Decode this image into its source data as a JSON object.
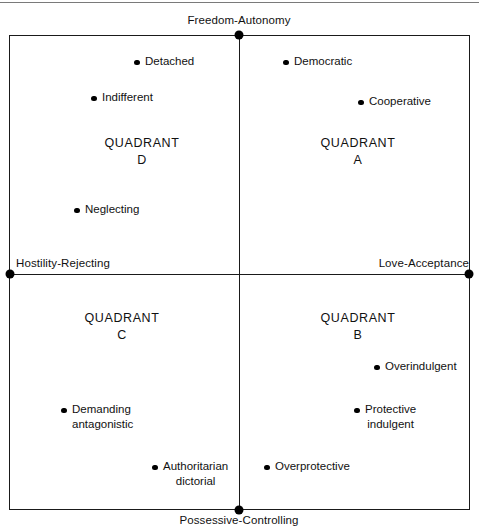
{
  "diagram": {
    "type": "two-axis-quadrant-map",
    "title_rule": true,
    "axes": {
      "top_label": "Freedom-Autonomy",
      "bottom_label": "Possessive-Controlling",
      "left_label": "Hostility-Rejecting",
      "right_label": "Love-Acceptance"
    },
    "quadrants": [
      {
        "id": "A",
        "name": "QUADRANT",
        "letter": "A",
        "x": 358,
        "y": 135
      },
      {
        "id": "B",
        "name": "QUADRANT",
        "letter": "B",
        "x": 358,
        "y": 310
      },
      {
        "id": "C",
        "name": "QUADRANT",
        "letter": "C",
        "x": 122,
        "y": 310
      },
      {
        "id": "D",
        "name": "QUADRANT",
        "letter": "D",
        "x": 142,
        "y": 135
      }
    ],
    "points": [
      {
        "label": "Detached",
        "label2": "",
        "quadrant": "D",
        "x": 134,
        "y": 61
      },
      {
        "label": "Indifferent",
        "label2": "",
        "quadrant": "D",
        "x": 91,
        "y": 97
      },
      {
        "label": "Neglecting",
        "label2": "",
        "quadrant": "D",
        "x": 74,
        "y": 209
      },
      {
        "label": "Democratic",
        "label2": "",
        "quadrant": "A",
        "x": 283,
        "y": 61
      },
      {
        "label": "Cooperative",
        "label2": "",
        "quadrant": "A",
        "x": 358,
        "y": 101
      },
      {
        "label": "Overindulgent",
        "label2": "",
        "quadrant": "B",
        "x": 374,
        "y": 366
      },
      {
        "label": "Protective",
        "label2": "indulgent",
        "quadrant": "B",
        "x": 354,
        "y": 409
      },
      {
        "label": "Overprotective",
        "label2": "",
        "quadrant": "B",
        "x": 264,
        "y": 466
      },
      {
        "label": "Demanding",
        "label2": "antagonistic",
        "quadrant": "C",
        "x": 61,
        "y": 409
      },
      {
        "label": "Authoritarian",
        "label2": "dictorial",
        "quadrant": "C",
        "x": 152,
        "y": 466
      }
    ],
    "axis_nodes": [
      {
        "name": "top-node",
        "x": 239,
        "y": 35
      },
      {
        "name": "bottom-node",
        "x": 239,
        "y": 510
      },
      {
        "name": "left-node",
        "x": 10,
        "y": 274
      },
      {
        "name": "right-node",
        "x": 469,
        "y": 274
      }
    ],
    "colors": {
      "line": "#1a1a1a",
      "text": "#111111",
      "rule": "#7a7a7a",
      "background": "#ffffff"
    }
  }
}
